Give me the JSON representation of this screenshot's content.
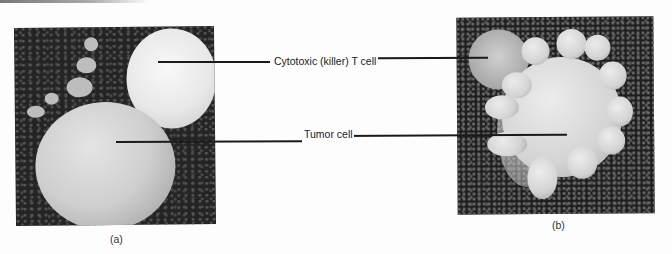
{
  "figure": {
    "panels": [
      {
        "id": "a",
        "caption": "(a)",
        "description": "Scanning electron micrograph: cytotoxic T cell attached to a round tumor cell"
      },
      {
        "id": "b",
        "caption": "(b)",
        "description": "Scanning electron micrograph: tumor cell with blebbed surface after T cell attack"
      }
    ],
    "labels": [
      {
        "text": "Cytotoxic (killer) T cell",
        "points_to": "T cell in both panels"
      },
      {
        "text": "Tumor cell",
        "points_to": "tumor cell in both panels"
      }
    ]
  }
}
